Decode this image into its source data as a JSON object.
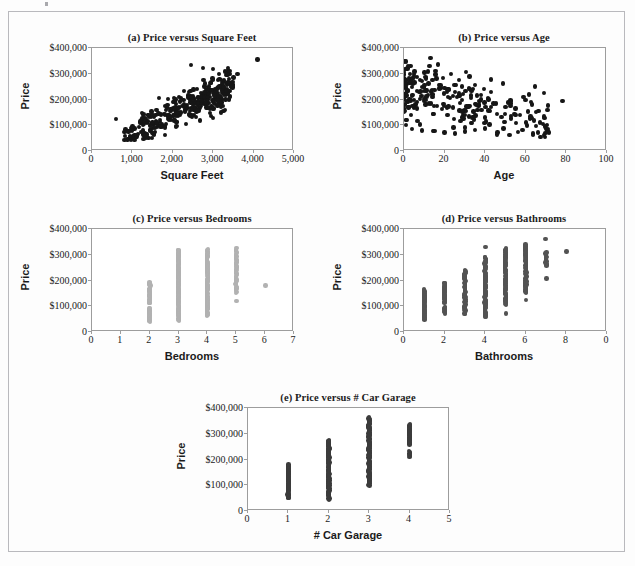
{
  "figure": {
    "caption_letters": [
      "(a)",
      "(b)",
      "(c)",
      "(d)",
      "(e)"
    ],
    "border_color": "#b9b9bd",
    "background": "#fdfdfd"
  },
  "chart_data": [
    {
      "id": "a",
      "type": "scatter",
      "title": "(a) Price versus Square Feet",
      "xlabel": "Square Feet",
      "ylabel": "Price",
      "xlim": [
        0,
        5000
      ],
      "ylim": [
        0,
        400000
      ],
      "xticks": [
        0,
        1000,
        2000,
        3000,
        4000,
        5000
      ],
      "xticklabels": [
        "0",
        "1,000",
        "2,000",
        "3,000",
        "4,000",
        "5,000"
      ],
      "yticks": [
        0,
        100000,
        200000,
        300000,
        400000
      ],
      "yticklabels": [
        "0",
        "$100,000",
        "$200,000",
        "$300,000",
        "$400,000"
      ],
      "grid": false,
      "legend": null,
      "marker_color": "#161616",
      "marker_size": 4.4,
      "n_points": 320,
      "correlation": 0.82,
      "notes": "Strong positive linear relationship; cloud widens with size; one low outlier near 600 sq ft at $125,000 and one high outlier near 4,100 sq ft at $355,000.",
      "points": [
        [
          600,
          125000
        ],
        [
          4100,
          355000
        ],
        [
          3000,
          128000
        ],
        [
          2450,
          335000
        ],
        [
          2750,
          322000
        ],
        [
          3000,
          318000
        ],
        [
          3150,
          300000
        ],
        [
          3400,
          310000
        ],
        [
          3600,
          300000
        ],
        [
          3500,
          285000
        ],
        [
          2900,
          250000
        ],
        [
          2800,
          262000
        ],
        [
          2600,
          240000
        ],
        [
          2400,
          230000
        ],
        [
          2200,
          205000
        ],
        [
          2000,
          190000
        ],
        [
          1800,
          175000
        ],
        [
          1600,
          160000
        ],
        [
          1400,
          140000
        ],
        [
          1200,
          115000
        ],
        [
          1000,
          95000
        ],
        [
          900,
          75000
        ],
        [
          1100,
          62000
        ],
        [
          1300,
          58000
        ],
        [
          1500,
          70000
        ],
        [
          1700,
          95000
        ],
        [
          1900,
          120000
        ],
        [
          2100,
          150000
        ],
        [
          2300,
          175000
        ],
        [
          2500,
          200000
        ],
        [
          2700,
          225000
        ],
        [
          3050,
          240000
        ]
      ]
    },
    {
      "id": "b",
      "type": "scatter",
      "title": "(b) Price versus Age",
      "xlabel": "Age",
      "ylabel": "Price",
      "xlim": [
        0,
        100
      ],
      "ylim": [
        0,
        400000
      ],
      "xticks": [
        0,
        20,
        40,
        60,
        80,
        100
      ],
      "xticklabels": [
        "0",
        "20",
        "40",
        "60",
        "80",
        "100"
      ],
      "yticks": [
        0,
        100000,
        200000,
        300000,
        400000
      ],
      "yticklabels": [
        "0",
        "$100,000",
        "$200,000",
        "$300,000",
        "$400,000"
      ],
      "grid": false,
      "legend": null,
      "marker_color": "#161616",
      "marker_size": 4.4,
      "n_points": 240,
      "correlation": -0.55,
      "notes": "Negative relationship; heavy concentration at ages 0-5 spanning $80,000-$350,000; outliers at age 13 / $360,000, age 43 / $277,000 and age 78 / $193,000.",
      "points": [
        [
          13,
          360000
        ],
        [
          43,
          277000
        ],
        [
          78,
          193000
        ],
        [
          1,
          348000
        ],
        [
          2,
          330000
        ],
        [
          3,
          300000
        ],
        [
          5,
          290000
        ],
        [
          8,
          275000
        ],
        [
          12,
          262000
        ],
        [
          18,
          255000
        ],
        [
          22,
          240000
        ],
        [
          27,
          225000
        ],
        [
          33,
          215000
        ],
        [
          38,
          200000
        ],
        [
          44,
          185000
        ],
        [
          50,
          170000
        ],
        [
          55,
          140000
        ],
        [
          60,
          110000
        ],
        [
          65,
          98000
        ],
        [
          70,
          88000
        ],
        [
          71,
          85000
        ],
        [
          1,
          100000
        ],
        [
          4,
          85000
        ],
        [
          9,
          80000
        ],
        [
          15,
          78000
        ],
        [
          20,
          72000
        ],
        [
          25,
          68000
        ],
        [
          30,
          75000
        ],
        [
          35,
          82000
        ],
        [
          40,
          88000
        ],
        [
          46,
          72000
        ],
        [
          52,
          62000
        ]
      ]
    },
    {
      "id": "c",
      "type": "scatter",
      "title": "(c) Price versus Bedrooms",
      "xlabel": "Bedrooms",
      "ylabel": "Price",
      "xlim": [
        0,
        7
      ],
      "ylim": [
        0,
        400000
      ],
      "xticks": [
        0,
        1,
        2,
        3,
        4,
        5,
        6,
        7
      ],
      "xticklabels": [
        "0",
        "1",
        "2",
        "3",
        "4",
        "5",
        "6",
        "7"
      ],
      "yticks": [
        0,
        100000,
        200000,
        300000,
        400000
      ],
      "yticklabels": [
        "0",
        "$100,000",
        "$200,000",
        "$300,000",
        "$400,000"
      ],
      "grid": false,
      "legend": null,
      "marker_color": "#b2b2b2",
      "marker_size": 4.4,
      "n_points": 320,
      "correlation": 0.5,
      "notes": "Discrete vertical strips at each bedroom count. 2 BR: $40,000-$193,000 with a gap near $100,000. 3 BR: $45,000-$320,000. 4 BR: $62,000-$320,000. 5 BR: $118,000-$325,000. 6 BR: single point at $180,000.",
      "columns": [
        {
          "x": 2,
          "ymin": 40000,
          "ymax": 193000,
          "count": 70,
          "gaps": [
            [
              95000,
              110000
            ]
          ]
        },
        {
          "x": 3,
          "ymin": 45000,
          "ymax": 320000,
          "count": 130,
          "gaps": []
        },
        {
          "x": 4,
          "ymin": 62000,
          "ymax": 320000,
          "count": 95,
          "gaps": []
        },
        {
          "x": 5,
          "ymin": 150000,
          "ymax": 325000,
          "count": 40,
          "gaps": []
        },
        {
          "x": 5,
          "ymin": 118000,
          "ymax": 120000,
          "count": 1,
          "gaps": []
        },
        {
          "x": 6,
          "ymin": 180000,
          "ymax": 180000,
          "count": 1,
          "gaps": []
        }
      ]
    },
    {
      "id": "d",
      "type": "scatter",
      "title": "(d) Price versus Bathrooms",
      "xlabel": "Bathrooms",
      "ylabel": "Price",
      "xlim": [
        0,
        10
      ],
      "ylim": [
        0,
        400000
      ],
      "xticks": [
        0,
        2,
        4,
        6,
        8,
        10
      ],
      "xticklabels": [
        "0",
        "2",
        "4",
        "6",
        "8",
        "0"
      ],
      "yticks": [
        0,
        100000,
        200000,
        300000,
        400000
      ],
      "yticklabels": [
        "0",
        "$100,000",
        "$200,000",
        "$300,000",
        "$400,000"
      ],
      "grid": false,
      "legend": null,
      "marker_color": "#535353",
      "marker_size": 4.4,
      "n_points": 320,
      "correlation": 0.72,
      "notes": "Vertical strips rising with bathroom count; last x tick label is clipped and reads '0'. Outliers: 4 BA at $330,000, 5 BA at $72,000, 6 BA at $125,000, 7 BA at $362,000 and $207,000, 8 BA at $312,000.",
      "columns": [
        {
          "x": 1,
          "ymin": 48000,
          "ymax": 165000,
          "count": 45,
          "gaps": []
        },
        {
          "x": 2,
          "ymin": 72000,
          "ymax": 190000,
          "count": 55,
          "gaps": [
            [
              100000,
              112000
            ]
          ]
        },
        {
          "x": 3,
          "ymin": 70000,
          "ymax": 240000,
          "count": 70,
          "gaps": []
        },
        {
          "x": 4,
          "ymin": 58000,
          "ymax": 292000,
          "count": 90,
          "gaps": []
        },
        {
          "x": 4,
          "ymin": 330000,
          "ymax": 330000,
          "count": 1,
          "gaps": []
        },
        {
          "x": 5,
          "ymin": 105000,
          "ymax": 325000,
          "count": 70,
          "gaps": []
        },
        {
          "x": 5,
          "ymin": 72000,
          "ymax": 72000,
          "count": 1,
          "gaps": []
        },
        {
          "x": 6,
          "ymin": 152000,
          "ymax": 340000,
          "count": 65,
          "gaps": []
        },
        {
          "x": 6,
          "ymin": 125000,
          "ymax": 125000,
          "count": 1,
          "gaps": []
        },
        {
          "x": 7,
          "ymin": 258000,
          "ymax": 308000,
          "count": 14,
          "gaps": []
        },
        {
          "x": 7,
          "ymin": 362000,
          "ymax": 362000,
          "count": 1,
          "gaps": []
        },
        {
          "x": 7,
          "ymin": 207000,
          "ymax": 207000,
          "count": 1,
          "gaps": []
        },
        {
          "x": 8,
          "ymin": 312000,
          "ymax": 312000,
          "count": 1,
          "gaps": []
        }
      ]
    },
    {
      "id": "e",
      "type": "scatter",
      "title": "(e) Price versus # Car Garage",
      "xlabel": "# Car Garage",
      "ylabel": "Price",
      "xlim": [
        0,
        5
      ],
      "ylim": [
        0,
        400000
      ],
      "xticks": [
        0,
        1,
        2,
        3,
        4,
        5
      ],
      "xticklabels": [
        "0",
        "1",
        "2",
        "3",
        "4",
        "5"
      ],
      "yticks": [
        0,
        100000,
        200000,
        300000,
        400000
      ],
      "yticklabels": [
        "0",
        "$100,000",
        "$200,000",
        "$300,000",
        "$400,000"
      ],
      "grid": false,
      "legend": null,
      "marker_color": "#3c3c3c",
      "marker_size": 4.6,
      "n_points": 320,
      "correlation": 0.68,
      "notes": "Strips rise with garage capacity. 1 car: $50,000-$180,000. 2 car: $45,000-$275,000. 3 car: $100,000-$362,000. 4 car: $258,000-$335,000 plus a detached pair near $210,000-$232,000.",
      "columns": [
        {
          "x": 1,
          "ymin": 50000,
          "ymax": 180000,
          "count": 60,
          "gaps": []
        },
        {
          "x": 2,
          "ymin": 45000,
          "ymax": 275000,
          "count": 95,
          "gaps": []
        },
        {
          "x": 3,
          "ymin": 100000,
          "ymax": 362000,
          "count": 110,
          "gaps": []
        },
        {
          "x": 4,
          "ymin": 258000,
          "ymax": 335000,
          "count": 30,
          "gaps": []
        },
        {
          "x": 4,
          "ymin": 208000,
          "ymax": 232000,
          "count": 6,
          "gaps": []
        }
      ]
    }
  ]
}
